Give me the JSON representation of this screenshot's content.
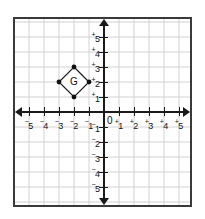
{
  "chart_data": {
    "type": "scatter",
    "title": "",
    "xlabel": "",
    "ylabel": "",
    "xlim": [
      -5.8,
      5.8
    ],
    "ylim": [
      -5.8,
      5.8
    ],
    "grid": true,
    "legend": null,
    "x_ticks": [
      -5,
      -4,
      -3,
      -2,
      -1,
      1,
      2,
      3,
      4,
      5
    ],
    "y_ticks": [
      -5,
      -4,
      -3,
      -2,
      -1,
      1,
      2,
      3,
      4,
      5
    ],
    "x_tick_labels": [
      "⁻5",
      "⁻4",
      "⁻3",
      "⁻2",
      "⁻1",
      "⁺1",
      "⁺2",
      "⁺3",
      "⁺4",
      "⁺5"
    ],
    "y_tick_labels": [
      "⁻5",
      "⁻4",
      "⁻3",
      "⁻2",
      "⁻1",
      "⁺1",
      "⁺2",
      "⁺3",
      "⁺4",
      "⁺5"
    ],
    "origin_label": "0",
    "shapes": [
      {
        "name": "G",
        "label": "G",
        "type": "polygon",
        "vertices": [
          {
            "x": -2,
            "y": 3
          },
          {
            "x": -1,
            "y": 2
          },
          {
            "x": -2,
            "y": 1
          },
          {
            "x": -3,
            "y": 2
          }
        ],
        "label_position": {
          "x": -2,
          "y": 2
        },
        "vertex_marker": "filled-circle"
      }
    ]
  },
  "colors": {
    "grid": "#d2d2d2",
    "axis": "#1a1a1a",
    "border": "#3a3a3a",
    "background": "#ffffff",
    "shape_stroke": "#1a1a1a",
    "shape_fill": "#ffffff",
    "text": "#111111"
  }
}
